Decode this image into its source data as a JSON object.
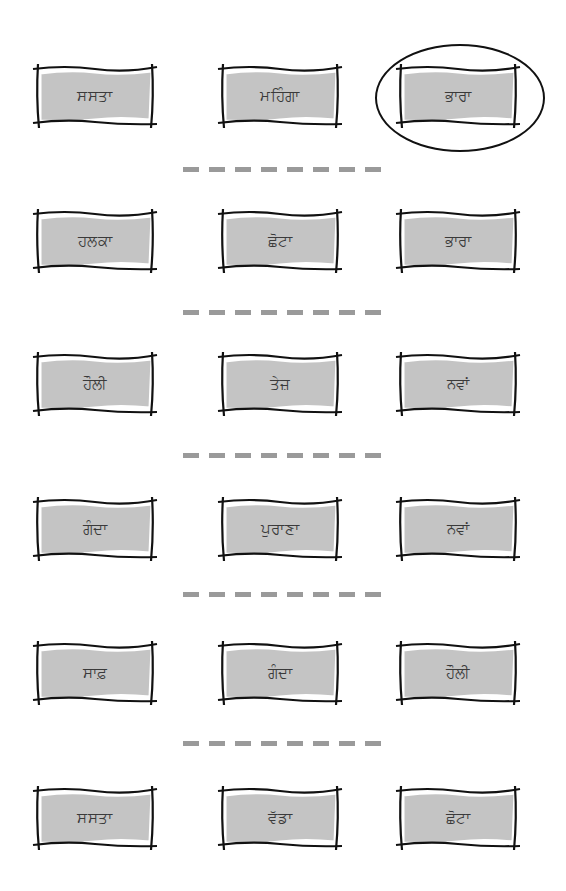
{
  "worksheet": {
    "colors": {
      "card_fill": "#c4c4c4",
      "card_inner_highlight": "#ffffff",
      "card_outline": "#111111",
      "dash": "#9a9a9a",
      "text": "#3a3a3a",
      "circle": "#111111"
    },
    "rows": [
      {
        "cards": [
          {
            "label": "ਸਸਤਾ",
            "circled": false
          },
          {
            "label": "ਮਹਿੰਗਾ",
            "circled": false
          },
          {
            "label": "ਭਾਰਾ",
            "circled": true
          }
        ]
      },
      {
        "cards": [
          {
            "label": "ਹਲਕਾ",
            "circled": false
          },
          {
            "label": "ਛੋਟਾ",
            "circled": false
          },
          {
            "label": "ਭਾਰਾ",
            "circled": false
          }
        ]
      },
      {
        "cards": [
          {
            "label": "ਹੌਲੀ",
            "circled": false
          },
          {
            "label": "ਤੇਜ਼",
            "circled": false
          },
          {
            "label": "ਨਵਾਂ",
            "circled": false
          }
        ]
      },
      {
        "cards": [
          {
            "label": "ਗੰਦਾ",
            "circled": false
          },
          {
            "label": "ਪੁਰਾਣਾ",
            "circled": false
          },
          {
            "label": "ਨਵਾਂ",
            "circled": false
          }
        ]
      },
      {
        "cards": [
          {
            "label": "ਸਾਫ਼",
            "circled": false
          },
          {
            "label": "ਗੰਦਾ",
            "circled": false
          },
          {
            "label": "ਹੌਲੀ",
            "circled": false
          }
        ]
      },
      {
        "cards": [
          {
            "label": "ਸਸਤਾ",
            "circled": false
          },
          {
            "label": "ਵੱਡਾ",
            "circled": false
          },
          {
            "label": "ਛੋਟਾ",
            "circled": false
          }
        ]
      }
    ],
    "separator_dash_count": 8
  }
}
